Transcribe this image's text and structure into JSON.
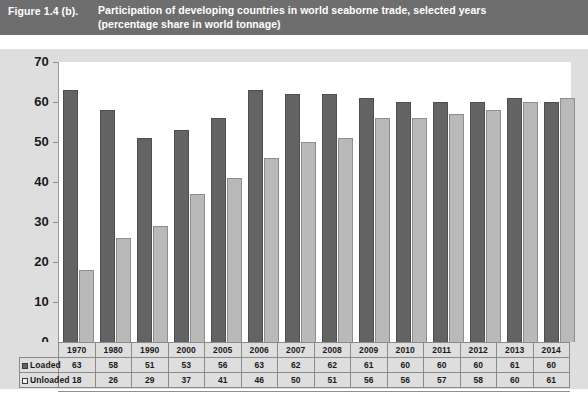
{
  "header": {
    "figure_number": "Figure 1.4 (b).",
    "caption_line1": "Participation of developing countries in world seaborne trade, selected years",
    "caption_line2": "(percentage share in world tonnage)",
    "bar_color": "#6e6e6e",
    "text_color": "#ffffff"
  },
  "legend": {
    "loaded_label": "Loaded",
    "unloaded_label": "Unloaded",
    "loaded_marker": "filled-square-icon",
    "unloaded_marker": "hollow-square-icon"
  },
  "colors": {
    "loaded_bar": "#636363",
    "unloaded_bar": "#b9b9b9",
    "panel_background": "#dedede",
    "plot_background": "#ffffff",
    "axis": "#8f8f8f"
  },
  "chart_data": {
    "type": "bar",
    "title": "Participation of developing countries in world seaborne trade, selected years (percentage share in world tonnage)",
    "xlabel": "",
    "ylabel": "",
    "ylim": [
      0,
      70
    ],
    "yticks": [
      0,
      10,
      20,
      30,
      40,
      50,
      60,
      70
    ],
    "ytick_labels": [
      "0",
      "10",
      "20",
      "30",
      "40",
      "50",
      "60",
      "70"
    ],
    "grid": false,
    "legend_position": "table-row-labels",
    "categories": [
      "1970",
      "1980",
      "1990",
      "2000",
      "2005",
      "2006",
      "2007",
      "2008",
      "2009",
      "2010",
      "2011",
      "2012",
      "2013",
      "2014"
    ],
    "series": [
      {
        "name": "Loaded",
        "color": "#636363",
        "values": [
          63,
          58,
          51,
          53,
          56,
          63,
          62,
          62,
          61,
          60,
          60,
          60,
          61,
          60
        ]
      },
      {
        "name": "Unloaded",
        "color": "#b9b9b9",
        "values": [
          18,
          26,
          29,
          37,
          41,
          46,
          50,
          51,
          56,
          56,
          57,
          58,
          60,
          61
        ]
      }
    ]
  }
}
